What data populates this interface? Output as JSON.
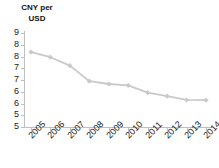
{
  "title": {
    "line1": "CNY per",
    "line2": "USD"
  },
  "chart_data": {
    "type": "line",
    "title": "CNY per USD",
    "xlabel": "",
    "ylabel": "CNY per USD",
    "categories": [
      "2005",
      "2006",
      "2007",
      "2008",
      "2009",
      "2010",
      "2011",
      "2012",
      "2013",
      "2014"
    ],
    "values": [
      8.19,
      7.97,
      7.61,
      6.95,
      6.83,
      6.77,
      6.46,
      6.31,
      6.15,
      6.14
    ],
    "series": [
      {
        "name": "CNY per USD",
        "values": [
          8.19,
          7.97,
          7.61,
          6.95,
          6.83,
          6.77,
          6.46,
          6.31,
          6.15,
          6.14
        ]
      }
    ],
    "ylim": [
      5,
      9
    ],
    "ytick_values": [
      5,
      5.5,
      6,
      6.5,
      7,
      7.5,
      8,
      8.5,
      9
    ],
    "ytick_labels": [
      "5",
      "6",
      "6",
      "7",
      "7",
      "8",
      "8",
      "9"
    ],
    "ytick_labels_displayed": [
      "9",
      "8",
      "8",
      "7",
      "7",
      "6",
      "6",
      "5"
    ],
    "grid": false,
    "legend": false,
    "legend_position": "none",
    "marker": "diamond",
    "line_color": "#c9c9c9",
    "axis_color": "#bfbfbf",
    "text_color": "#222222"
  }
}
